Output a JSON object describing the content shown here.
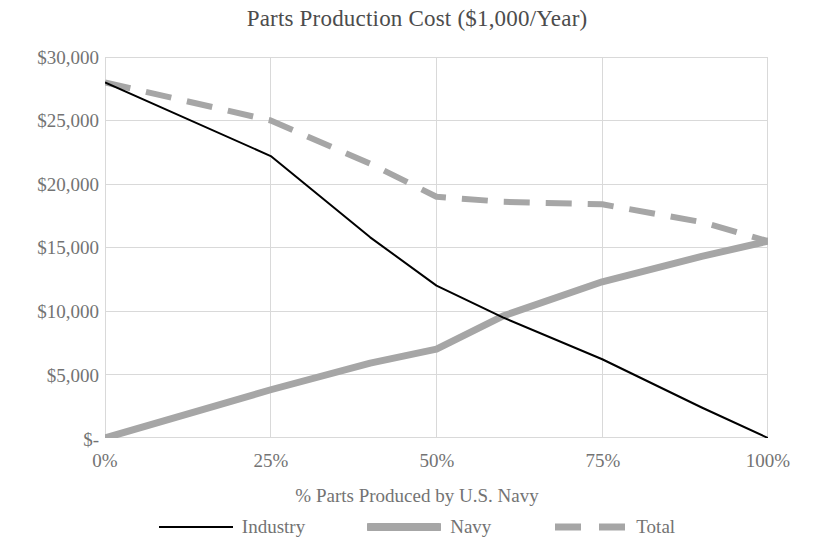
{
  "chart_data": {
    "type": "line",
    "title": "Parts Production Cost ($1,000/Year)",
    "xlabel": "% Parts Produced by U.S. Navy",
    "ylabel": "",
    "x": [
      0,
      25,
      40,
      50,
      60,
      75,
      90,
      100
    ],
    "xlim": [
      0,
      100
    ],
    "ylim": [
      0,
      30000
    ],
    "grid": true,
    "legend_position": "bottom",
    "x_tick_labels": [
      "0%",
      "25%",
      "50%",
      "75%",
      "100%"
    ],
    "x_tick_values": [
      0,
      25,
      50,
      75,
      100
    ],
    "y_tick_labels": [
      "$30,000",
      "$25,000",
      "$20,000",
      "$15,000",
      "$10,000",
      "$5,000",
      "$-"
    ],
    "y_tick_values": [
      30000,
      25000,
      20000,
      15000,
      10000,
      5000,
      0
    ],
    "series": [
      {
        "name": "Industry",
        "style": "solid-thin",
        "color": "#000000",
        "x": [
          0,
          25,
          40,
          50,
          60,
          75,
          90,
          100
        ],
        "values": [
          28000,
          22200,
          15800,
          12000,
          9500,
          6200,
          2400,
          0
        ]
      },
      {
        "name": "Navy",
        "style": "solid-thick",
        "color": "#a6a6a6",
        "x": [
          0,
          25,
          40,
          50,
          60,
          75,
          90,
          100
        ],
        "values": [
          0,
          3800,
          5900,
          7000,
          9600,
          12300,
          14300,
          15500
        ]
      },
      {
        "name": "Total",
        "style": "dashed-thick",
        "color": "#a6a6a6",
        "x": [
          0,
          25,
          40,
          50,
          60,
          75,
          90,
          100
        ],
        "values": [
          28000,
          25000,
          21600,
          19000,
          18600,
          18400,
          17000,
          15500
        ]
      }
    ]
  },
  "title": "Parts Production Cost ($1,000/Year)",
  "axes": {
    "x_title": "% Parts Produced by U.S. Navy",
    "x_ticks": [
      "0%",
      "25%",
      "50%",
      "75%",
      "100%"
    ],
    "y_ticks": [
      "$30,000",
      "$25,000",
      "$20,000",
      "$15,000",
      "$10,000",
      "$5,000",
      "$-"
    ]
  },
  "legend": {
    "items": [
      {
        "label": "Industry",
        "swatch": "solid-thin-line-swatch"
      },
      {
        "label": "Navy",
        "swatch": "solid-thick-line-swatch"
      },
      {
        "label": "Total",
        "swatch": "dashed-thick-line-swatch"
      }
    ]
  },
  "colors": {
    "industry": "#000000",
    "navy": "#a6a6a6",
    "total": "#a6a6a6",
    "grid": "#d9d9d9",
    "text": "#737373",
    "title": "#4c4c4c",
    "background": "#ffffff"
  }
}
